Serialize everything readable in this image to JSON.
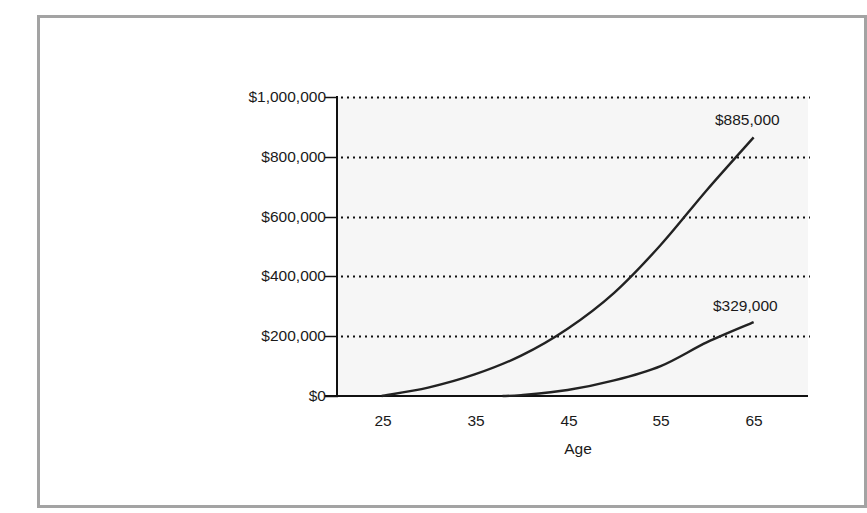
{
  "chart_data": {
    "type": "line",
    "title": "",
    "xlabel": "Age",
    "ylabel": "",
    "x_ticks": [
      25,
      35,
      45,
      55,
      65
    ],
    "y_ticks": [
      "$0",
      "$200,000",
      "$400,000",
      "$600,000",
      "$800,000",
      "$1,000,000"
    ],
    "y_tick_values": [
      0,
      200000,
      400000,
      600000,
      800000,
      1000000
    ],
    "xlim": [
      20,
      70
    ],
    "ylim": [
      0,
      1000000
    ],
    "grid": "horizontal dotted",
    "series": [
      {
        "name": "Start saving at 25",
        "x": [
          25,
          30,
          35,
          40,
          45,
          50,
          55,
          60,
          65
        ],
        "values": [
          0,
          28000,
          72000,
          135000,
          225000,
          345000,
          505000,
          690000,
          885000
        ],
        "end_label": "$885,000"
      },
      {
        "name": "Start saving at 38",
        "x": [
          38,
          40,
          45,
          50,
          55,
          60,
          65
        ],
        "values": [
          0,
          3000,
          20000,
          52000,
          100000,
          180000,
          329000
        ],
        "end_label": "$329,000"
      }
    ],
    "annotations": [
      "$885,000",
      "$329,000"
    ]
  },
  "labels": {
    "y": [
      "$1,000,000",
      "$800,000",
      "$600,000",
      "$400,000",
      "$200,000",
      "$0"
    ],
    "x": [
      "25",
      "35",
      "45",
      "55",
      "65"
    ],
    "xlabel": "Age",
    "annot1": "$885,000",
    "annot2": "$329,000"
  },
  "colors": {
    "frame": "#a3a3a3",
    "plot_bg": "#f6f6f6",
    "line": "#222222",
    "axis": "#111111"
  }
}
